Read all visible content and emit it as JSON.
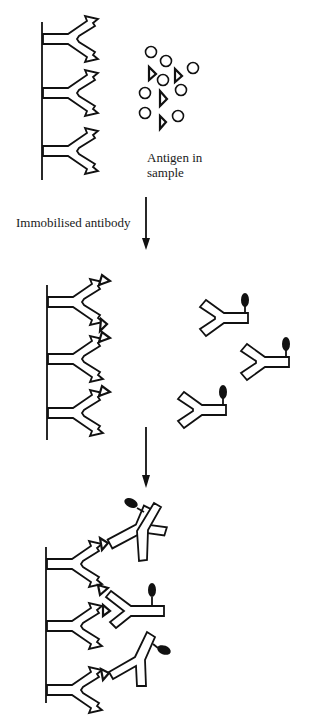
{
  "diagram": {
    "labels": {
      "antigen": "Antigen in\nsample",
      "immobilised": "Immobilised antibody"
    },
    "stages": [
      {
        "name": "stage-1",
        "description": "Immobilised antibodies on solid surface with free antigens in sample"
      },
      {
        "name": "stage-2",
        "description": "Antigens bound to immobilised antibodies; labelled detection antibodies in solution"
      },
      {
        "name": "stage-3",
        "description": "Labelled antibodies bound to captured antigens (sandwich)"
      }
    ],
    "legend_items": [
      "antibody",
      "antigen-circle",
      "antigen-triangle",
      "enzyme-label"
    ],
    "colors": {
      "ink": "#111111",
      "background": "#ffffff"
    }
  }
}
